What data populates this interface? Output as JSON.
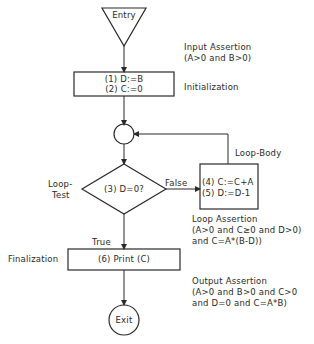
{
  "nodes": {
    "entry": "Entry",
    "init_line1": "(1) D:=B",
    "init_line2": "(2) C:=0",
    "test": "(3) D=0?",
    "body_line1": "(4) C:=C+A",
    "body_line2": "(5) D:=D-1",
    "final": "(6) Print (C)",
    "exit": "Exit"
  },
  "edges": {
    "false_label": "False",
    "true_label": "True"
  },
  "annotations": {
    "input_assertion_title": "Input Assertion",
    "input_assertion_body": "(A>0 and B>0)",
    "initialization": "Initialization",
    "loop_body": "Loop-Body",
    "loop_test_line1": "Loop-",
    "loop_test_line2": "Test",
    "loop_assertion_title": "Loop Assertion",
    "loop_assertion_line1": "(A>0 and C≥0 and D>0)",
    "loop_assertion_line2": "and C=A*(B-D))",
    "finalization": "Finalization",
    "output_assertion_title": "Output Assertion",
    "output_assertion_line1": "(A>0 and B>0 and C>0",
    "output_assertion_line2": "and D=0 and C=A*B)"
  },
  "colors": {
    "stroke": "#2a2a2a",
    "background": "#ffffff"
  }
}
